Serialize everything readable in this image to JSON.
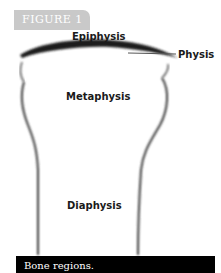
{
  "figure": {
    "tab_label": "FIGURE 1",
    "caption": "Bone regions."
  },
  "labels": {
    "epiphysis": "Epiphysis",
    "physis": "Physis",
    "metaphysis": "Metaphysis",
    "diaphysis": "Diaphysis"
  },
  "colors": {
    "tab_bg": "#c9c9c9",
    "caption_bg": "#000000",
    "outline": "#2a2a2a"
  }
}
